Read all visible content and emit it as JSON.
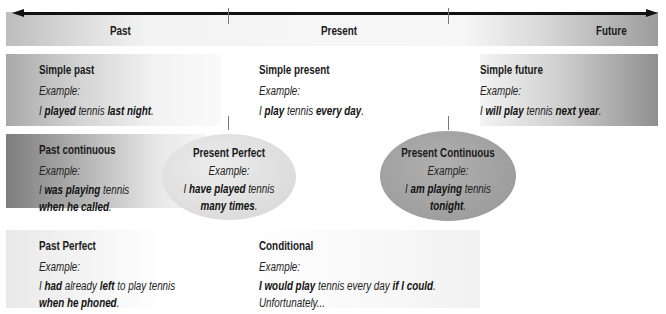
{
  "timeline": {
    "labels": [
      "Past",
      "Present",
      "Future"
    ]
  },
  "cells": {
    "simple_past": {
      "title": "Simple past",
      "example_label": "Example:",
      "sentence": [
        {
          "text": "I ",
          "bold": false
        },
        {
          "text": "played",
          "bold": true
        },
        {
          "text": " tennis ",
          "bold": false
        },
        {
          "text": "last night",
          "bold": true
        },
        {
          "text": ".",
          "bold": false
        }
      ]
    },
    "simple_present": {
      "title": "Simple present",
      "example_label": "Example:",
      "sentence": [
        {
          "text": "I ",
          "bold": false
        },
        {
          "text": "play",
          "bold": true
        },
        {
          "text": " tennis ",
          "bold": false
        },
        {
          "text": "every day",
          "bold": true
        },
        {
          "text": ".",
          "bold": false
        }
      ]
    },
    "simple_future": {
      "title": "Simple future",
      "example_label": "Example:",
      "sentence": [
        {
          "text": "I ",
          "bold": false
        },
        {
          "text": "will play",
          "bold": true
        },
        {
          "text": " tennis ",
          "bold": false
        },
        {
          "text": "next year",
          "bold": true
        },
        {
          "text": ".",
          "bold": false
        }
      ]
    },
    "past_continuous": {
      "title": "Past continuous",
      "example_label": "Example:",
      "line1": [
        {
          "text": "I ",
          "bold": false
        },
        {
          "text": "was playing",
          "bold": true
        },
        {
          "text": " tennis",
          "bold": false
        }
      ],
      "line2": [
        {
          "text": "when he called",
          "bold": true
        },
        {
          "text": ".",
          "bold": false
        }
      ]
    },
    "present_perfect": {
      "title": "Present Perfect",
      "example_label": "Example:",
      "line1": [
        {
          "text": "I ",
          "bold": false
        },
        {
          "text": "have played",
          "bold": true
        },
        {
          "text": " tennis",
          "bold": false
        }
      ],
      "line2": [
        {
          "text": "many times",
          "bold": true
        },
        {
          "text": ".",
          "bold": false
        }
      ]
    },
    "present_continuous": {
      "title": "Present Continuous",
      "example_label": "Example:",
      "line1": [
        {
          "text": "I ",
          "bold": false
        },
        {
          "text": "am playing",
          "bold": true
        },
        {
          "text": " tennis",
          "bold": false
        }
      ],
      "line2": [
        {
          "text": "tonight",
          "bold": true
        },
        {
          "text": ".",
          "bold": false
        }
      ]
    },
    "past_perfect": {
      "title": "Past Perfect",
      "example_label": "Example:",
      "line1": [
        {
          "text": "I ",
          "bold": false
        },
        {
          "text": "had",
          "bold": true
        },
        {
          "text": " already ",
          "bold": false
        },
        {
          "text": "left",
          "bold": true
        },
        {
          "text": " to play tennis",
          "bold": false
        }
      ],
      "line2": [
        {
          "text": "when he phoned",
          "bold": true
        },
        {
          "text": ".",
          "bold": false
        }
      ]
    },
    "conditional": {
      "title": "Conditional",
      "example_label": "Example:",
      "line1": [
        {
          "text": "I would play",
          "bold": true
        },
        {
          "text": " tennis every day ",
          "bold": false
        },
        {
          "text": "if I could",
          "bold": true
        },
        {
          "text": ".",
          "bold": false
        }
      ],
      "line2": [
        {
          "text": "Unfortunately...",
          "bold": false
        }
      ]
    }
  },
  "colors": {
    "arrow": "#111111",
    "dark_gray": "#8e8e8e",
    "light_gray": "#f3f3f3"
  }
}
